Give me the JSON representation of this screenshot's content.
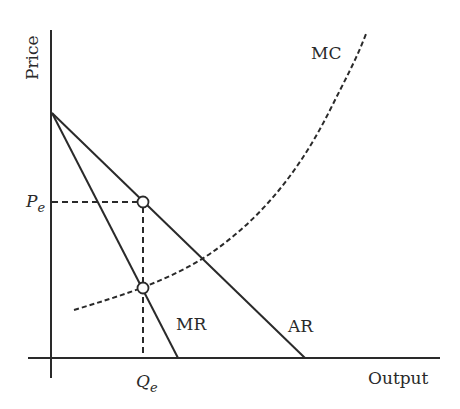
{
  "diagram": {
    "type": "monopoly-equilibrium",
    "axes": {
      "y_label": "Price",
      "x_label": "Output"
    },
    "curves": {
      "mc": "MC",
      "mr": "MR",
      "ar": "AR"
    },
    "equilibrium": {
      "price_label": "P",
      "price_sub": "e",
      "quantity_label": "Q",
      "quantity_sub": "e"
    },
    "colors": {
      "ink": "#2a2a2a",
      "background": "#ffffff"
    }
  }
}
